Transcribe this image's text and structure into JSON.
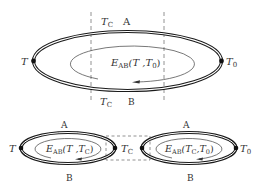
{
  "diagram": {
    "colors": {
      "line": "#1a1a1a",
      "thin": "#555555",
      "dash": "#777777",
      "text": "#333333"
    },
    "top_circuit": {
      "conductor_top": "A",
      "conductor_bottom": "B",
      "node_left": {
        "sym": "T",
        "sub": ""
      },
      "node_right": {
        "sym": "T",
        "sub": "0"
      },
      "section_top_label": {
        "sym": "T",
        "sub": "C"
      },
      "section_bottom_label": {
        "sym": "T",
        "sub": "C"
      },
      "emf": {
        "E": "E",
        "sub": "AB",
        "args": "(T ,T",
        "arg_sub": "0",
        "close": ")"
      }
    },
    "bottom_left_circuit": {
      "conductor_top": "A",
      "conductor_bottom": "B",
      "node_left": {
        "sym": "T",
        "sub": ""
      },
      "emf": {
        "E": "E",
        "sub": "AB",
        "args": "(T ,T",
        "arg_sub": "C",
        "close": ")"
      }
    },
    "junction_label": {
      "sym": "T",
      "sub": "C"
    },
    "bottom_right_circuit": {
      "conductor_top": "A",
      "conductor_bottom": "B",
      "node_right": {
        "sym": "T",
        "sub": "0"
      },
      "emf": {
        "E": "E",
        "sub": "AB",
        "args1": "(T",
        "args1_sub": "C",
        "args2": ",T",
        "arg_sub": "0",
        "close": ")"
      }
    }
  }
}
